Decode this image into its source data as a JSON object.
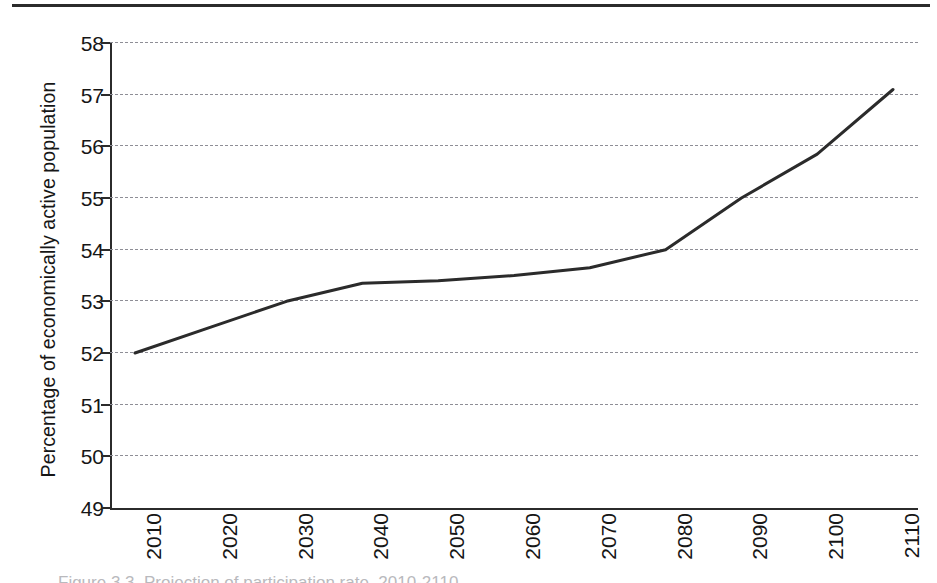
{
  "page": {
    "rule_present": true,
    "caption_partial": "Figure 3.3. Projection of participation rate, 2010-2110"
  },
  "chart_data": {
    "type": "line",
    "title": "",
    "xlabel": "",
    "ylabel": "Percentage of economically active population",
    "categories": [
      "2010",
      "2020",
      "2030",
      "2040",
      "2050",
      "2060",
      "2070",
      "2080",
      "2090",
      "2100",
      "2110"
    ],
    "values": [
      52.0,
      52.5,
      53.0,
      53.35,
      53.4,
      53.5,
      53.65,
      54.0,
      55.0,
      55.85,
      57.1
    ],
    "series": [
      {
        "name": "Economically active population",
        "values": [
          52.0,
          52.5,
          53.0,
          53.35,
          53.4,
          53.5,
          53.65,
          54.0,
          55.0,
          55.85,
          57.1
        ],
        "color": "#2b2b2b"
      }
    ],
    "ylim": [
      49,
      58
    ],
    "xlim": [
      "2010",
      "2110"
    ],
    "ytick_labels": [
      "58",
      "57",
      "56",
      "55",
      "54",
      "53",
      "52",
      "51",
      "50",
      "49"
    ],
    "ytick_values": [
      58,
      57,
      56,
      55,
      54,
      53,
      52,
      51,
      50,
      49
    ],
    "xtick_labels": [
      "2010",
      "2020",
      "2030",
      "2040",
      "2050",
      "2060",
      "2070",
      "2080",
      "2090",
      "2100",
      "2110"
    ],
    "grid": "horizontal-dashed",
    "grid_color": "#8e8e96",
    "legend": "none",
    "line_color": "#2b2b2b",
    "line_width": 3
  }
}
